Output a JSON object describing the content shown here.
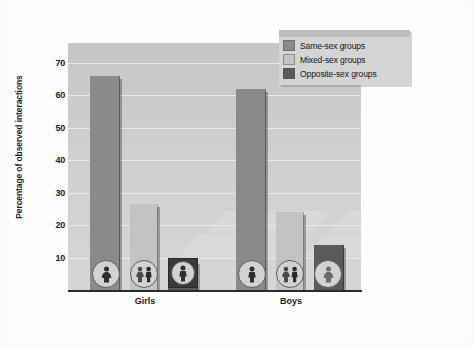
{
  "chart_data": {
    "type": "bar",
    "title": "",
    "xlabel": "",
    "ylabel": "Percentage of observed interactions",
    "categories": [
      "Girls",
      "Boys"
    ],
    "ylim": [
      0,
      76
    ],
    "yticks": [
      10,
      20,
      30,
      40,
      50,
      60,
      70
    ],
    "grid": true,
    "legend_position": "top-right",
    "series": [
      {
        "name": "Same-sex groups",
        "color": "#8a8a8a",
        "values": [
          66,
          62
        ]
      },
      {
        "name": "Mixed-sex groups",
        "color": "#c3c3c3",
        "values": [
          26.5,
          24
        ]
      },
      {
        "name": "Opposite-sex groups",
        "color": "#5a5a5a",
        "values": [
          9,
          14
        ]
      }
    ],
    "bar_icons": [
      [
        "female-icon",
        "mixed-female-male-icon",
        "male-icon"
      ],
      [
        "male-icon",
        "mixed-female-male-icon",
        "female-icon"
      ]
    ]
  },
  "legend": {
    "items": [
      {
        "label": "Same-sex groups",
        "color": "#8a8a8a"
      },
      {
        "label": "Mixed-sex groups",
        "color": "#c3c3c3"
      },
      {
        "label": "Opposite-sex groups",
        "color": "#5a5a5a"
      }
    ]
  },
  "axes": {
    "y_title": "Percentage of observed interactions",
    "y_tick_labels": [
      "70",
      "60",
      "50",
      "40",
      "30",
      "20",
      "10"
    ],
    "x_tick_labels": [
      "Girls",
      "Boys"
    ]
  }
}
